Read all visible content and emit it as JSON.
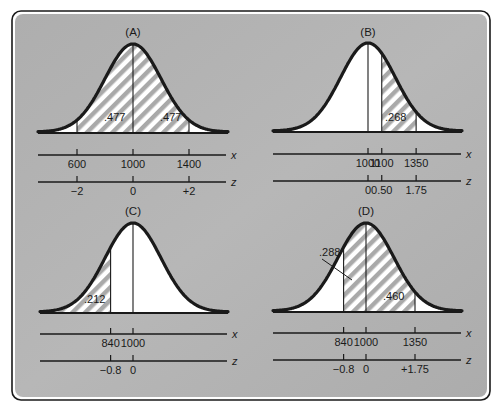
{
  "figure": {
    "colors": {
      "panel_bg": "#b2b2b2",
      "curve": "#1a1a1a",
      "under_curve": "#ffffff",
      "hatch": "#a9a9a9",
      "frame": "#1a1a1a"
    },
    "x_axis_letter": "x",
    "z_axis_letter": "z"
  },
  "chart_data": [
    {
      "type": "area",
      "panel": "A",
      "title": "(A)",
      "mean": 1000,
      "sd": 200,
      "shaded_regions": [
        {
          "from_x": 600,
          "to_x": 1000,
          "area": ".477"
        },
        {
          "from_x": 1000,
          "to_x": 1400,
          "area": ".477"
        }
      ],
      "x_ticks": [
        "600",
        "1000",
        "1400"
      ],
      "z_ticks": [
        "−2",
        "0",
        "+2"
      ],
      "xlabel": "x",
      "zlabel": "z"
    },
    {
      "type": "area",
      "panel": "B",
      "title": "(B)",
      "mean": 1000,
      "sd": 200,
      "shaded_regions": [
        {
          "from_x": 1100,
          "to_x": 1350,
          "area": ".268"
        }
      ],
      "x_ticks": [
        "1000",
        "1100",
        "1350"
      ],
      "z_ticks": [
        "0",
        "0.50",
        "1.75"
      ],
      "xlabel": "x",
      "zlabel": "z"
    },
    {
      "type": "area",
      "panel": "C",
      "title": "(C)",
      "mean": 1000,
      "sd": 200,
      "shaded_regions": [
        {
          "from_x": null,
          "to_x": 840,
          "area": ".212"
        }
      ],
      "x_ticks": [
        "840",
        "1000"
      ],
      "z_ticks": [
        "−0.8",
        "0"
      ],
      "xlabel": "x",
      "zlabel": "z"
    },
    {
      "type": "area",
      "panel": "D",
      "title": "(D)",
      "mean": 1000,
      "sd": 200,
      "shaded_regions": [
        {
          "from_x": 840,
          "to_x": 1000,
          "area": ".288"
        },
        {
          "from_x": 1000,
          "to_x": 1350,
          "area": ".460"
        }
      ],
      "x_ticks": [
        "840",
        "1000",
        "1350"
      ],
      "z_ticks": [
        "−0.8",
        "0",
        "+1.75"
      ],
      "xlabel": "x",
      "zlabel": "z"
    }
  ]
}
